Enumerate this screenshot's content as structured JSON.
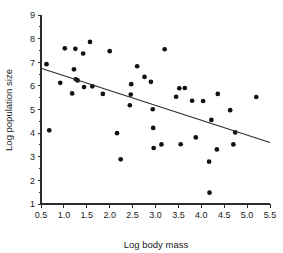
{
  "chart_data": {
    "type": "scatter",
    "title": "",
    "xlabel": "Log body mass",
    "ylabel": "Log population size",
    "xlim": [
      0.5,
      5.5
    ],
    "ylim": [
      1,
      9
    ],
    "grid": false,
    "legend": null,
    "xticks": [
      "0.5",
      "1.0",
      "1.5",
      "2.0",
      "2.5",
      "3.0",
      "3.5",
      "4.0",
      "4.5",
      "5.0",
      "5.5"
    ],
    "xtick_values": [
      0.5,
      1.0,
      1.5,
      2.0,
      2.5,
      3.0,
      3.5,
      4.0,
      4.5,
      5.0,
      5.5
    ],
    "yticks": [
      "1",
      "2",
      "3",
      "4",
      "5",
      "6",
      "7",
      "8",
      "9"
    ],
    "ytick_values": [
      1,
      2,
      3,
      4,
      5,
      6,
      7,
      8,
      9
    ],
    "point_color": "#111111",
    "line_color": "#2b2b2b",
    "axis_color": "#2b2b2b",
    "background_color": "#ffffff",
    "points": [
      [
        0.62,
        6.92
      ],
      [
        0.68,
        4.12
      ],
      [
        0.92,
        6.13
      ],
      [
        1.02,
        7.59
      ],
      [
        1.18,
        5.68
      ],
      [
        1.22,
        6.7
      ],
      [
        1.25,
        7.57
      ],
      [
        1.26,
        6.28
      ],
      [
        1.3,
        6.23
      ],
      [
        1.42,
        7.37
      ],
      [
        1.44,
        5.95
      ],
      [
        1.57,
        7.86
      ],
      [
        1.62,
        5.98
      ],
      [
        1.85,
        5.66
      ],
      [
        2.0,
        7.47
      ],
      [
        2.16,
        4.0
      ],
      [
        2.24,
        2.89
      ],
      [
        2.44,
        5.18
      ],
      [
        2.46,
        5.63
      ],
      [
        2.47,
        6.07
      ],
      [
        2.6,
        6.83
      ],
      [
        2.76,
        6.38
      ],
      [
        2.9,
        6.17
      ],
      [
        2.94,
        5.01
      ],
      [
        2.95,
        4.22
      ],
      [
        2.96,
        3.37
      ],
      [
        3.13,
        3.52
      ],
      [
        3.2,
        7.55
      ],
      [
        3.45,
        5.54
      ],
      [
        3.52,
        5.9
      ],
      [
        3.55,
        3.53
      ],
      [
        3.64,
        5.91
      ],
      [
        3.8,
        5.37
      ],
      [
        3.88,
        3.82
      ],
      [
        4.04,
        5.36
      ],
      [
        4.17,
        2.79
      ],
      [
        4.18,
        1.48
      ],
      [
        4.22,
        4.56
      ],
      [
        4.34,
        3.31
      ],
      [
        4.36,
        5.66
      ],
      [
        4.63,
        4.97
      ],
      [
        4.7,
        3.52
      ],
      [
        4.74,
        4.03
      ],
      [
        5.2,
        5.53
      ]
    ],
    "fit_line": {
      "x_start": 0.5,
      "y_start": 6.75,
      "x_end": 5.5,
      "y_end": 3.6,
      "slope": -0.63,
      "intercept": 7.065
    }
  }
}
